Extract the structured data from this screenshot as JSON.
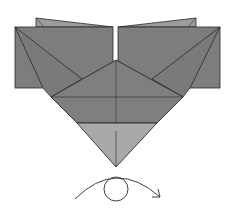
{
  "diagram": {
    "type": "origami-step",
    "colors": {
      "background": "#ffffff",
      "paper_dark": "#7a7a7a",
      "paper_mid": "#858585",
      "paper_light": "#a9a9a9",
      "back_flap": "#9c9c9c",
      "line": "#2a2a2a"
    },
    "parts": [
      {
        "name": "left-back-flap"
      },
      {
        "name": "right-back-flap"
      },
      {
        "name": "left-rectangle-flap"
      },
      {
        "name": "right-rectangle-flap"
      },
      {
        "name": "central-kite"
      },
      {
        "name": "bottom-light-triangle"
      }
    ],
    "symbols": [
      {
        "name": "turn-over-symbol",
        "meaning": "turn the model over"
      }
    ]
  }
}
